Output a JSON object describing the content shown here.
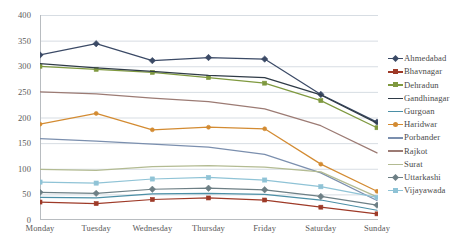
{
  "chart_data": {
    "type": "line",
    "title": "",
    "xlabel": "",
    "ylabel": "",
    "ylim": [
      0,
      400
    ],
    "ytick_step": 50,
    "yticks": [
      0,
      50,
      100,
      150,
      200,
      250,
      300,
      350,
      400
    ],
    "grid": "horizontal",
    "legend_position": "right",
    "categories": [
      "Monday",
      "Tuesday",
      "Wednesday",
      "Thursday",
      "Friday",
      "Saturday",
      "Sunday"
    ],
    "series": [
      {
        "name": "Ahmedabad",
        "color": "#3b4a66",
        "marker": "diamond",
        "marker_size": 3.2,
        "values": [
          322,
          344,
          311,
          317,
          314,
          245,
          191
        ]
      },
      {
        "name": "Bhavnagar",
        "color": "#9e3a28",
        "marker": "square",
        "marker_size": 4.0,
        "values": [
          35,
          32,
          40,
          43,
          39,
          25,
          12
        ]
      },
      {
        "name": "Dehradun",
        "color": "#7f993f",
        "marker": "square",
        "marker_size": 4.0,
        "values": [
          300,
          294,
          288,
          278,
          267,
          233,
          180
        ]
      },
      {
        "name": "Gandhinagar",
        "color": "#2f3b47",
        "marker": "none",
        "marker_size": 0,
        "values": [
          305,
          297,
          290,
          282,
          278,
          244,
          189
        ]
      },
      {
        "name": "Gurgoan",
        "color": "#4b8fa6",
        "marker": "none",
        "marker_size": 0,
        "values": [
          44,
          43,
          51,
          52,
          50,
          39,
          19
        ]
      },
      {
        "name": "Haridwar",
        "color": "#d38b32",
        "marker": "circle",
        "marker_size": 4.0,
        "values": [
          187,
          208,
          176,
          181,
          178,
          109,
          56
        ]
      },
      {
        "name": "Porbander",
        "color": "#7b8fae",
        "marker": "none",
        "marker_size": 0,
        "values": [
          159,
          154,
          148,
          142,
          128,
          92,
          38
        ]
      },
      {
        "name": "Rajkot",
        "color": "#9c7b74",
        "marker": "none",
        "marker_size": 0,
        "values": [
          250,
          246,
          238,
          231,
          217,
          184,
          131
        ]
      },
      {
        "name": "Surat",
        "color": "#b3bb92",
        "marker": "none",
        "marker_size": 0,
        "values": [
          99,
          97,
          104,
          106,
          103,
          94,
          45
        ]
      },
      {
        "name": "Uttarkashi",
        "color": "#6d7f85",
        "marker": "diamond",
        "marker_size": 3.2,
        "values": [
          54,
          52,
          60,
          62,
          59,
          46,
          29
        ]
      },
      {
        "name": "Vijayawada",
        "color": "#8fc3d6",
        "marker": "square",
        "marker_size": 4.2,
        "values": [
          74,
          72,
          80,
          83,
          78,
          65,
          44
        ]
      }
    ]
  },
  "axis": {
    "y_labels": [
      "400",
      "350",
      "300",
      "250",
      "200",
      "150",
      "100",
      "50",
      "0"
    ],
    "x_labels": [
      "Monday",
      "Tuesday",
      "Wednesday",
      "Thursday",
      "Friday",
      "Saturday",
      "Sunday"
    ]
  },
  "legend": {
    "items": [
      {
        "label": "Ahmedabad"
      },
      {
        "label": "Bhavnagar"
      },
      {
        "label": "Dehradun"
      },
      {
        "label": "Gandhinagar"
      },
      {
        "label": "Gurgoan"
      },
      {
        "label": "Haridwar"
      },
      {
        "label": "Porbander"
      },
      {
        "label": "Rajkot"
      },
      {
        "label": "Surat"
      },
      {
        "label": "Uttarkashi"
      },
      {
        "label": "Vijayawada"
      }
    ]
  },
  "style": {
    "grid_color": "#d7dde3",
    "axis_color": "#b8bcc0",
    "tick_text_color": "#595959",
    "legend_text_color": "#4a4a4a",
    "background": "#ffffff"
  }
}
